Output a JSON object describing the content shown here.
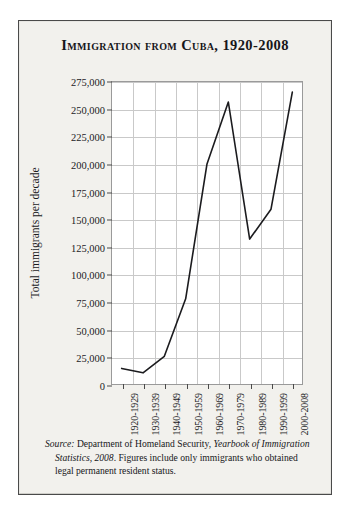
{
  "panel": {
    "title": "Immigration from Cuba, 1920-2008"
  },
  "note": {
    "source_label": "Source:",
    "agency": " Department of Homeland Security, ",
    "publication": "Yearbook of Immigration Statistics, 2008",
    "rest": ". Figures include only immigrants who obtained legal permanent resident status."
  },
  "chart_data": {
    "type": "line",
    "title": "Immigration from Cuba, 1920-2008",
    "xlabel": "",
    "ylabel": "Total immigrants per decade",
    "categories": [
      "1920-1929",
      "1930-1939",
      "1940-1949",
      "1950-1959",
      "1960-1969",
      "1970-1979",
      "1980-1989",
      "1990-1999",
      "2000-2008"
    ],
    "values": [
      15000,
      11000,
      26000,
      78000,
      200000,
      256000,
      132000,
      159000,
      265000
    ],
    "ylim": [
      0,
      275000
    ],
    "ytick_values": [
      0,
      25000,
      50000,
      75000,
      100000,
      125000,
      150000,
      175000,
      200000,
      225000,
      250000,
      275000
    ],
    "ytick_labels": [
      "0",
      "25,000",
      "50,000",
      "75,000",
      "100,000",
      "125,000",
      "150,000",
      "175,000",
      "200,000",
      "225,000",
      "250,000",
      "275,000"
    ],
    "grid": true,
    "legend": false,
    "line_color": "#1b1b1e",
    "grid_color": "#c9c9c9",
    "plot_background": "#ffffff"
  }
}
